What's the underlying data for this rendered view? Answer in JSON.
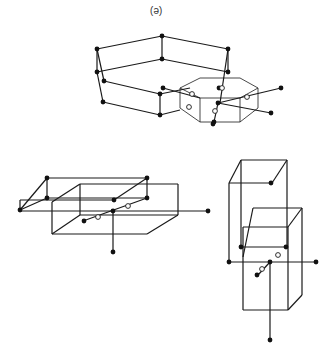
{
  "figure": {
    "panel_label": "(e)",
    "colors": {
      "line": "#1a1a1a",
      "dot": "#111111",
      "background": "#ffffff"
    }
  },
  "structures": [
    {
      "name": "hexagonal-frame-with-octagonal-prism",
      "solid_lines": [
        [
          97,
          49,
          162,
          36
        ],
        [
          162,
          36,
          228,
          49
        ],
        [
          97,
          72,
          162,
          59
        ],
        [
          162,
          59,
          228,
          72
        ],
        [
          162,
          36,
          162,
          59
        ],
        [
          97,
          49,
          97,
          72
        ],
        [
          97,
          49,
          104,
          81
        ],
        [
          97,
          72,
          103,
          102
        ],
        [
          104,
          81,
          160,
          94
        ],
        [
          103,
          102,
          160,
          115
        ],
        [
          160,
          94,
          160,
          115
        ],
        [
          228,
          49,
          220,
          103
        ],
        [
          228,
          49,
          228,
          72
        ],
        [
          163,
          88,
          200,
          98
        ],
        [
          160,
          94,
          190,
          88
        ],
        [
          160,
          115,
          180,
          110
        ],
        [
          218,
          103,
          281,
          88
        ],
        [
          218,
          103,
          271,
          113
        ],
        [
          218,
          103,
          214,
          122
        ]
      ],
      "thin_lines": [
        [
          180,
          88,
          200,
          78
        ],
        [
          200,
          78,
          240,
          78
        ],
        [
          240,
          78,
          258,
          88
        ],
        [
          258,
          88,
          258,
          108
        ],
        [
          258,
          108,
          240,
          122
        ],
        [
          240,
          122,
          200,
          122
        ],
        [
          200,
          122,
          180,
          108
        ],
        [
          180,
          108,
          180,
          88
        ],
        [
          180,
          88,
          200,
          98
        ],
        [
          200,
          98,
          240,
          98
        ],
        [
          240,
          98,
          258,
          88
        ],
        [
          200,
          98,
          200,
          122
        ],
        [
          240,
          98,
          240,
          122
        ]
      ],
      "dots": [
        [
          97,
          49
        ],
        [
          162,
          36
        ],
        [
          228,
          49
        ],
        [
          97,
          72
        ],
        [
          162,
          59
        ],
        [
          228,
          72
        ],
        [
          104,
          81
        ],
        [
          103,
          102
        ],
        [
          160,
          94
        ],
        [
          160,
          115
        ],
        [
          163,
          88
        ],
        [
          218,
          103
        ],
        [
          281,
          88
        ],
        [
          271,
          113
        ],
        [
          214,
          122
        ],
        [
          219,
          88
        ],
        [
          213,
          124
        ]
      ],
      "open_dots": [
        [
          222,
          88
        ],
        [
          215,
          111
        ],
        [
          192,
          94
        ],
        [
          247,
          97
        ],
        [
          189,
          107
        ]
      ]
    },
    {
      "name": "left-box-pair",
      "solid_lines": [
        [
          20,
          210,
          47,
          178
        ],
        [
          47,
          178,
          147,
          178
        ],
        [
          147,
          178,
          114,
          200
        ],
        [
          114,
          200,
          20,
          200
        ],
        [
          20,
          200,
          20,
          210
        ],
        [
          47,
          178,
          47,
          198
        ],
        [
          147,
          178,
          147,
          198
        ],
        [
          20,
          210,
          47,
          198
        ],
        [
          47,
          198,
          147,
          198
        ],
        [
          52,
          234,
          80,
          215
        ],
        [
          80,
          215,
          178,
          215
        ],
        [
          178,
          215,
          147,
          234
        ],
        [
          147,
          234,
          52,
          234
        ],
        [
          52,
          234,
          52,
          202
        ],
        [
          80,
          215,
          80,
          184
        ],
        [
          80,
          184,
          178,
          184
        ],
        [
          178,
          184,
          178,
          215
        ],
        [
          52,
          202,
          80,
          184
        ],
        [
          20,
          211,
          208,
          211
        ],
        [
          83,
          221,
          147,
          198
        ],
        [
          113,
          211,
          113,
          252
        ]
      ],
      "dots": [
        [
          47,
          198
        ],
        [
          147,
          198
        ],
        [
          47,
          178
        ],
        [
          147,
          178
        ],
        [
          20,
          210
        ],
        [
          114,
          200
        ],
        [
          113,
          211
        ],
        [
          208,
          211
        ],
        [
          113,
          252
        ],
        [
          84,
          221
        ]
      ],
      "open_dots": [
        [
          128,
          206
        ],
        [
          98,
          217
        ]
      ]
    },
    {
      "name": "right-tall-box-pair",
      "solid_lines": [
        [
          229,
          183,
          241,
          160
        ],
        [
          241,
          160,
          287,
          160
        ],
        [
          287,
          160,
          272,
          183
        ],
        [
          272,
          183,
          229,
          183
        ],
        [
          229,
          183,
          229,
          262
        ],
        [
          241,
          160,
          241,
          247
        ],
        [
          287,
          160,
          287,
          247
        ],
        [
          243,
          257,
          253,
          208
        ],
        [
          253,
          208,
          302,
          208
        ],
        [
          302,
          208,
          288,
          227
        ],
        [
          288,
          227,
          243,
          227
        ],
        [
          243,
          227,
          243,
          310
        ],
        [
          243,
          310,
          288,
          310
        ],
        [
          288,
          310,
          302,
          295
        ],
        [
          302,
          295,
          302,
          208
        ],
        [
          288,
          227,
          288,
          310
        ],
        [
          241,
          247,
          287,
          247
        ],
        [
          229,
          262,
          316,
          262
        ],
        [
          270,
          262,
          258,
          275
        ],
        [
          270,
          262,
          270,
          340
        ]
      ],
      "dots": [
        [
          241,
          247
        ],
        [
          286,
          247
        ],
        [
          271,
          183
        ],
        [
          229,
          262
        ],
        [
          270,
          262
        ],
        [
          316,
          262
        ],
        [
          270,
          340
        ],
        [
          257,
          275
        ]
      ],
      "open_dots": [
        [
          278,
          255
        ],
        [
          262,
          269
        ]
      ]
    }
  ]
}
